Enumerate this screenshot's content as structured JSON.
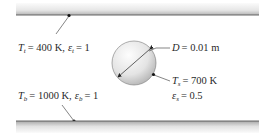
{
  "diagram": {
    "top_plate": {
      "symbol": "T",
      "subscript": "t",
      "temperature": "= 400 K,",
      "emissivity_symbol": "ε",
      "emissivity": "= 1"
    },
    "bottom_plate": {
      "symbol": "T",
      "subscript": "b",
      "temperature": "= 1000 K,",
      "emissivity_symbol": "ε",
      "emissivity": "= 1"
    },
    "sphere": {
      "diameter_symbol": "D",
      "diameter": "= 0.01 m",
      "temp_symbol": "T",
      "temp_subscript": "s",
      "temperature": "= 700 K",
      "emissivity_symbol": "ε",
      "emissivity_subscript": "s",
      "emissivity": "= 0.5"
    },
    "colors": {
      "plate_light": "#f2f2f2",
      "plate_dark": "#9a9a9a",
      "plate_edge": "#555555",
      "sphere_light": "#fafafa",
      "sphere_dark": "#bdbdbd",
      "line": "#222222"
    }
  }
}
